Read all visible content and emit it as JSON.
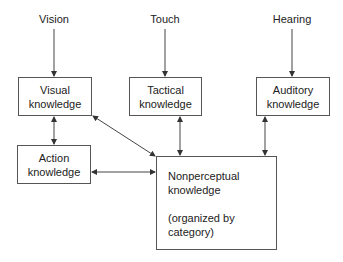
{
  "diagram": {
    "inputs": [
      {
        "id": "vision",
        "label": "Vision"
      },
      {
        "id": "touch",
        "label": "Touch"
      },
      {
        "id": "hearing",
        "label": "Hearing"
      }
    ],
    "nodes": {
      "visual": {
        "line1": "Visual",
        "line2": "knowledge"
      },
      "tactical": {
        "line1": "Tactical",
        "line2": "knowledge"
      },
      "auditory": {
        "line1": "Auditory",
        "line2": "knowledge"
      },
      "action": {
        "line1": "Action",
        "line2": "knowledge"
      },
      "nonperceptual": {
        "line1": "Nonperceptual",
        "line2": "knowledge",
        "line3": "(organized by",
        "line4": "category)"
      }
    },
    "edges": [
      {
        "from": "Vision",
        "to": "Visual knowledge",
        "type": "directed"
      },
      {
        "from": "Touch",
        "to": "Tactical knowledge",
        "type": "directed"
      },
      {
        "from": "Hearing",
        "to": "Auditory knowledge",
        "type": "directed"
      },
      {
        "from": "Visual knowledge",
        "to": "Action knowledge",
        "type": "bidirectional"
      },
      {
        "from": "Visual knowledge",
        "to": "Nonperceptual knowledge",
        "type": "bidirectional"
      },
      {
        "from": "Action knowledge",
        "to": "Nonperceptual knowledge",
        "type": "bidirectional"
      },
      {
        "from": "Tactical knowledge",
        "to": "Nonperceptual knowledge",
        "type": "bidirectional"
      },
      {
        "from": "Auditory knowledge",
        "to": "Nonperceptual knowledge",
        "type": "bidirectional"
      }
    ],
    "colors": {
      "line": "#444444",
      "box_border": "#555555",
      "text": "#222222"
    }
  }
}
